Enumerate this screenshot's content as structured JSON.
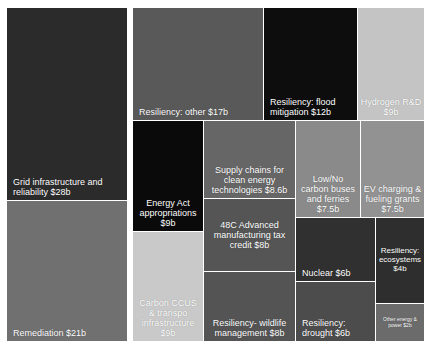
{
  "chart_data": {
    "type": "treemap",
    "title": "",
    "subtitle": "",
    "xlabel": "",
    "ylabel": "",
    "units": "billions of USD",
    "legend": "none",
    "grid": false,
    "background_color": "#ffffff",
    "categories": [
      "Grid infrastructure and reliability",
      "Remediation",
      "Resiliency: other",
      "Resiliency: flood mitigation",
      "Hydrogen R&D",
      "Energy Act appropriations",
      "Carbon CCUS & transpo infrastructure",
      "Supply chains for clean energy technologies",
      "48C Advanced manufacturing tax credit",
      "Resiliency- wildlife management",
      "Low/No carbon buses and ferries",
      "EV charging & fueling grants",
      "Nuclear",
      "Resiliency: drought",
      "Resiliency: ecosystems",
      "Other energy & power"
    ],
    "values": [
      28,
      21,
      17,
      12,
      9,
      9,
      9,
      8.6,
      8,
      8,
      7.5,
      7.5,
      6,
      6,
      4,
      2
    ],
    "tiles": [
      {
        "label": "Grid infrastructure and reliability $28b",
        "name": "Grid infrastructure and reliability",
        "value": 28,
        "value_text": "$28b",
        "color": "#2b2b2b",
        "x": 7,
        "y": 8,
        "w": 120,
        "h": 192,
        "align": "left",
        "valign": "bottom",
        "font_size": 9
      },
      {
        "label": "Remediation $21b",
        "name": "Remediation",
        "value": 21,
        "value_text": "$21b",
        "color": "#707070",
        "x": 7,
        "y": 201,
        "w": 120,
        "h": 140,
        "align": "left",
        "valign": "bottom",
        "font_size": 9
      },
      {
        "label": "Resiliency: other $17b",
        "name": "Resiliency: other",
        "value": 17,
        "value_text": "$17b",
        "color": "#595959",
        "x": 133,
        "y": 8,
        "w": 130,
        "h": 112,
        "align": "left",
        "valign": "bottom",
        "font_size": 9
      },
      {
        "label": "Resiliency: flood mitigation $12b",
        "name": "Resiliency: flood mitigation",
        "value": 12,
        "value_text": "$12b",
        "color": "#0d0d0d",
        "x": 264,
        "y": 8,
        "w": 93,
        "h": 112,
        "align": "left",
        "valign": "bottom",
        "font_size": 9
      },
      {
        "label": "Hydrogen R&D $9b",
        "name": "Hydrogen R&D",
        "value": 9,
        "value_text": "$9b",
        "color": "#c4c4c4",
        "x": 358,
        "y": 8,
        "w": 66,
        "h": 112,
        "align": "center",
        "valign": "bottom",
        "font_size": 9
      },
      {
        "label": "Energy Act appropriations $9b",
        "name": "Energy Act appropriations",
        "value": 9,
        "value_text": "$9b",
        "color": "#0a0a0a",
        "x": 133,
        "y": 121,
        "w": 70,
        "h": 110,
        "align": "center",
        "valign": "bottom",
        "font_size": 9
      },
      {
        "label": "Carbon CCUS & transpo infrastructure $9b",
        "name": "Carbon CCUS & transpo infrastructure",
        "value": 9,
        "value_text": "$9b",
        "color": "#c9c9c9",
        "x": 133,
        "y": 232,
        "w": 70,
        "h": 109,
        "align": "center",
        "valign": "bottom",
        "font_size": 9
      },
      {
        "label": "Supply chains for clean energy technologies $8.6b",
        "name": "Supply chains for clean energy technologies",
        "value": 8.6,
        "value_text": "$8.6b",
        "color": "#666666",
        "x": 204,
        "y": 121,
        "w": 91,
        "h": 77,
        "align": "center",
        "valign": "bottom",
        "font_size": 9
      },
      {
        "label": "48C Advanced manufacturing tax credit $8b",
        "name": "48C Advanced manufacturing tax credit",
        "value": 8,
        "value_text": "$8b",
        "color": "#555555",
        "x": 204,
        "y": 199,
        "w": 91,
        "h": 72,
        "align": "center",
        "valign": "middle",
        "font_size": 9
      },
      {
        "label": "Resiliency- wildlife management $8b",
        "name": "Resiliency- wildlife management",
        "value": 8,
        "value_text": "$8b",
        "color": "#545454",
        "x": 204,
        "y": 272,
        "w": 91,
        "h": 69,
        "align": "center",
        "valign": "bottom",
        "font_size": 9
      },
      {
        "label": "Low/No carbon buses and ferries $7.5b",
        "name": "Low/No carbon buses and ferries",
        "value": 7.5,
        "value_text": "$7.5b",
        "color": "#8a8a8a",
        "x": 296,
        "y": 121,
        "w": 64,
        "h": 96,
        "align": "center",
        "valign": "bottom",
        "font_size": 9
      },
      {
        "label": "EV charging & fueling grants $7.5b",
        "name": "EV charging & fueling grants",
        "value": 7.5,
        "value_text": "$7.5b",
        "color": "#929292",
        "x": 361,
        "y": 121,
        "w": 63,
        "h": 96,
        "align": "center",
        "valign": "bottom",
        "font_size": 9
      },
      {
        "label": "Nuclear $6b",
        "name": "Nuclear",
        "value": 6,
        "value_text": "$6b",
        "color": "#303030",
        "x": 296,
        "y": 218,
        "w": 79,
        "h": 63,
        "align": "left",
        "valign": "bottom",
        "font_size": 9
      },
      {
        "label": "Resiliency: drought $6b",
        "name": "Resiliency: drought",
        "value": 6,
        "value_text": "$6b",
        "color": "#4c4c4c",
        "x": 296,
        "y": 282,
        "w": 79,
        "h": 59,
        "align": "left",
        "valign": "bottom",
        "font_size": 9
      },
      {
        "label": "Resiliency: ecosystems $4b",
        "name": "Resiliency: ecosystems",
        "value": 4,
        "value_text": "$4b",
        "color": "#2e2e2e",
        "x": 376,
        "y": 218,
        "w": 48,
        "h": 85,
        "align": "center",
        "valign": "middle",
        "font_size": 8
      },
      {
        "label": "Other energy & power $2b",
        "name": "Other energy & power",
        "value": 2,
        "value_text": "$2b",
        "color": "#6b6b6b",
        "x": 376,
        "y": 304,
        "w": 48,
        "h": 37,
        "align": "center",
        "valign": "middle",
        "font_size": 5
      }
    ]
  }
}
